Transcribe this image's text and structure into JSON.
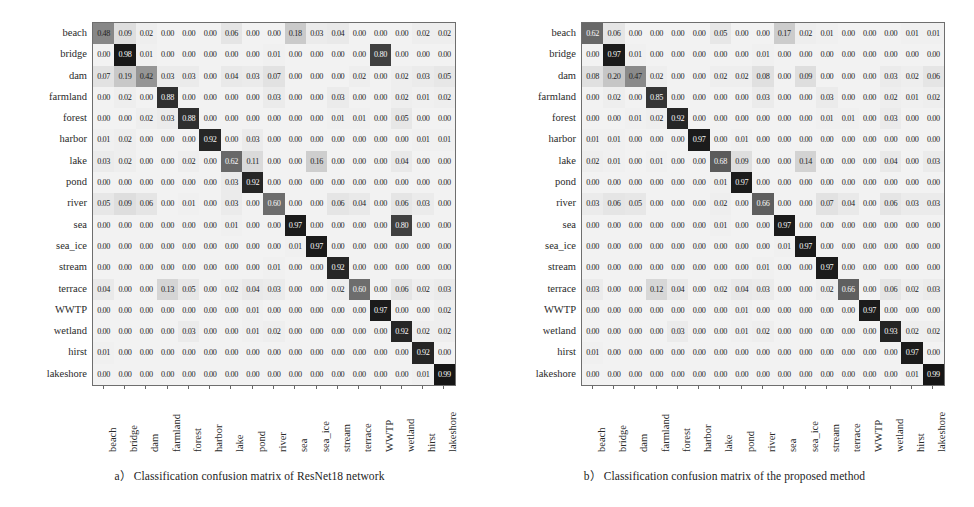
{
  "figure": {
    "type": "two-panel-confusion-matrix-figure",
    "background": "#ffffff"
  },
  "labels": [
    "beach",
    "bridge",
    "dam",
    "farmland",
    "forest",
    "harbor",
    "lake",
    "pond",
    "river",
    "sea",
    "sea_ice",
    "stream",
    "terrace",
    "WWTP",
    "wetland",
    "hirst",
    "lakeshore"
  ],
  "panels": [
    {
      "id": "a",
      "caption": "a） Classification confusion matrix of ResNet18 network"
    },
    {
      "id": "b",
      "caption": "b） Classification confusion matrix of the proposed method"
    }
  ],
  "chart_data": [
    {
      "type": "heatmap",
      "title": "a） Classification confusion matrix of ResNet18 network",
      "xlabel": "",
      "ylabel": "",
      "grid": true,
      "legend": "none",
      "colormap": "greys",
      "vmin": 0.0,
      "vmax": 1.0,
      "categories": [
        "beach",
        "bridge",
        "dam",
        "farmland",
        "forest",
        "harbor",
        "lake",
        "pond",
        "river",
        "sea",
        "sea_ice",
        "stream",
        "terrace",
        "WWTP",
        "wetland",
        "hirst",
        "lakeshore"
      ],
      "x": [
        "beach",
        "bridge",
        "dam",
        "farmland",
        "forest",
        "harbor",
        "lake",
        "pond",
        "river",
        "sea",
        "sea_ice",
        "stream",
        "terrace",
        "WWTP",
        "wetland",
        "hirst",
        "lakeshore"
      ],
      "y": [
        "beach",
        "bridge",
        "dam",
        "farmland",
        "forest",
        "harbor",
        "lake",
        "pond",
        "river",
        "sea",
        "sea_ice",
        "stream",
        "terrace",
        "WWTP",
        "wetland",
        "hirst",
        "lakeshore"
      ],
      "values": [
        [
          0.48,
          0.09,
          0.02,
          0.0,
          0.0,
          0.0,
          0.06,
          0.0,
          0.0,
          0.18,
          0.03,
          0.04,
          0.0,
          0.0,
          0.0,
          0.02,
          0.02
        ],
        [
          0.0,
          0.98,
          0.01,
          0.0,
          0.0,
          0.0,
          0.0,
          0.0,
          0.01,
          0.0,
          0.0,
          0.0,
          0.0,
          0.8,
          0.0,
          0.0,
          0.0
        ],
        [
          0.07,
          0.19,
          0.42,
          0.03,
          0.03,
          0.0,
          0.04,
          0.03,
          0.07,
          0.0,
          0.0,
          0.0,
          0.02,
          0.0,
          0.02,
          0.03,
          0.05
        ],
        [
          0.0,
          0.02,
          0.0,
          0.88,
          0.0,
          0.0,
          0.0,
          0.0,
          0.03,
          0.0,
          0.0,
          0.03,
          0.0,
          0.0,
          0.02,
          0.01,
          0.02
        ],
        [
          0.0,
          0.0,
          0.02,
          0.03,
          0.88,
          0.0,
          0.0,
          0.0,
          0.0,
          0.0,
          0.0,
          0.01,
          0.01,
          0.0,
          0.05,
          0.0,
          0.0
        ],
        [
          0.01,
          0.02,
          0.0,
          0.0,
          0.0,
          0.92,
          0.0,
          0.03,
          0.0,
          0.0,
          0.0,
          0.0,
          0.0,
          0.0,
          0.0,
          0.01,
          0.01
        ],
        [
          0.03,
          0.02,
          0.0,
          0.0,
          0.02,
          0.0,
          0.62,
          0.11,
          0.0,
          0.0,
          0.16,
          0.0,
          0.0,
          0.0,
          0.04,
          0.0,
          0.0
        ],
        [
          0.0,
          0.0,
          0.0,
          0.0,
          0.0,
          0.0,
          0.03,
          0.92,
          0.0,
          0.0,
          0.0,
          0.0,
          0.0,
          0.0,
          0.0,
          0.0,
          0.0
        ],
        [
          0.05,
          0.09,
          0.06,
          0.0,
          0.01,
          0.0,
          0.03,
          0.0,
          0.6,
          0.0,
          0.0,
          0.06,
          0.04,
          0.0,
          0.06,
          0.03,
          0.0
        ],
        [
          0.0,
          0.0,
          0.0,
          0.0,
          0.0,
          0.0,
          0.01,
          0.0,
          0.0,
          0.97,
          0.0,
          0.0,
          0.0,
          0.0,
          0.8,
          0.0,
          0.0
        ],
        [
          0.0,
          0.0,
          0.0,
          0.0,
          0.0,
          0.0,
          0.0,
          0.0,
          0.0,
          0.01,
          0.97,
          0.0,
          0.0,
          0.0,
          0.0,
          0.0,
          0.0
        ],
        [
          0.0,
          0.0,
          0.0,
          0.0,
          0.0,
          0.0,
          0.0,
          0.0,
          0.01,
          0.0,
          0.0,
          0.92,
          0.0,
          0.0,
          0.0,
          0.0,
          0.0
        ],
        [
          0.04,
          0.0,
          0.0,
          0.13,
          0.05,
          0.0,
          0.02,
          0.04,
          0.03,
          0.0,
          0.0,
          0.02,
          0.6,
          0.0,
          0.06,
          0.02,
          0.03
        ],
        [
          0.0,
          0.0,
          0.0,
          0.0,
          0.0,
          0.0,
          0.0,
          0.01,
          0.0,
          0.0,
          0.0,
          0.0,
          0.0,
          0.97,
          0.0,
          0.0,
          0.02
        ],
        [
          0.0,
          0.0,
          0.0,
          0.0,
          0.03,
          0.0,
          0.0,
          0.01,
          0.02,
          0.0,
          0.0,
          0.0,
          0.0,
          0.0,
          0.92,
          0.02,
          0.02
        ],
        [
          0.01,
          0.0,
          0.0,
          0.0,
          0.0,
          0.0,
          0.0,
          0.0,
          0.0,
          0.0,
          0.0,
          0.0,
          0.0,
          0.0,
          0.0,
          0.92,
          0.0
        ],
        [
          0.0,
          0.0,
          0.0,
          0.0,
          0.0,
          0.0,
          0.0,
          0.0,
          0.0,
          0.0,
          0.0,
          0.0,
          0.0,
          0.0,
          0.0,
          0.01,
          0.99
        ]
      ]
    },
    {
      "type": "heatmap",
      "title": "b） Classification confusion matrix of the proposed method",
      "xlabel": "",
      "ylabel": "",
      "grid": true,
      "legend": "none",
      "colormap": "greys",
      "vmin": 0.0,
      "vmax": 1.0,
      "categories": [
        "beach",
        "bridge",
        "dam",
        "farmland",
        "forest",
        "harbor",
        "lake",
        "pond",
        "river",
        "sea",
        "sea_ice",
        "stream",
        "terrace",
        "WWTP",
        "wetland",
        "hirst",
        "lakeshore"
      ],
      "x": [
        "beach",
        "bridge",
        "dam",
        "farmland",
        "forest",
        "harbor",
        "lake",
        "pond",
        "river",
        "sea",
        "sea_ice",
        "stream",
        "terrace",
        "WWTP",
        "wetland",
        "hirst",
        "lakeshore"
      ],
      "y": [
        "beach",
        "bridge",
        "dam",
        "farmland",
        "forest",
        "harbor",
        "lake",
        "pond",
        "river",
        "sea",
        "sea_ice",
        "stream",
        "terrace",
        "WWTP",
        "wetland",
        "hirst",
        "lakeshore"
      ],
      "values": [
        [
          0.62,
          0.06,
          0.0,
          0.0,
          0.0,
          0.0,
          0.05,
          0.0,
          0.0,
          0.17,
          0.02,
          0.01,
          0.0,
          0.0,
          0.0,
          0.01,
          0.01
        ],
        [
          0.0,
          0.97,
          0.01,
          0.0,
          0.0,
          0.0,
          0.0,
          0.0,
          0.01,
          0.0,
          0.0,
          0.0,
          0.0,
          0.0,
          0.0,
          0.0,
          0.0
        ],
        [
          0.08,
          0.2,
          0.47,
          0.02,
          0.0,
          0.0,
          0.02,
          0.02,
          0.08,
          0.0,
          0.09,
          0.0,
          0.0,
          0.0,
          0.03,
          0.02,
          0.06
        ],
        [
          0.0,
          0.02,
          0.0,
          0.85,
          0.0,
          0.0,
          0.0,
          0.0,
          0.03,
          0.0,
          0.0,
          0.03,
          0.0,
          0.0,
          0.02,
          0.01,
          0.02
        ],
        [
          0.0,
          0.0,
          0.01,
          0.02,
          0.92,
          0.0,
          0.0,
          0.0,
          0.0,
          0.0,
          0.0,
          0.01,
          0.01,
          0.0,
          0.03,
          0.0,
          0.0
        ],
        [
          0.01,
          0.01,
          0.0,
          0.0,
          0.0,
          0.97,
          0.0,
          0.01,
          0.0,
          0.0,
          0.0,
          0.0,
          0.0,
          0.0,
          0.0,
          0.0,
          0.0
        ],
        [
          0.02,
          0.01,
          0.0,
          0.01,
          0.0,
          0.0,
          0.68,
          0.09,
          0.0,
          0.0,
          0.14,
          0.0,
          0.0,
          0.0,
          0.04,
          0.0,
          0.03
        ],
        [
          0.0,
          0.0,
          0.0,
          0.0,
          0.0,
          0.0,
          0.01,
          0.97,
          0.0,
          0.0,
          0.0,
          0.0,
          0.0,
          0.0,
          0.0,
          0.0,
          0.0
        ],
        [
          0.03,
          0.06,
          0.05,
          0.0,
          0.0,
          0.0,
          0.02,
          0.0,
          0.66,
          0.0,
          0.0,
          0.07,
          0.04,
          0.0,
          0.06,
          0.03,
          0.03
        ],
        [
          0.0,
          0.0,
          0.0,
          0.0,
          0.0,
          0.0,
          0.01,
          0.0,
          0.0,
          0.97,
          0.0,
          0.0,
          0.0,
          0.0,
          0.0,
          0.0,
          0.0
        ],
        [
          0.0,
          0.0,
          0.0,
          0.0,
          0.0,
          0.0,
          0.0,
          0.0,
          0.0,
          0.01,
          0.97,
          0.0,
          0.0,
          0.0,
          0.0,
          0.0,
          0.0
        ],
        [
          0.0,
          0.0,
          0.0,
          0.0,
          0.0,
          0.0,
          0.0,
          0.0,
          0.01,
          0.0,
          0.0,
          0.97,
          0.0,
          0.0,
          0.0,
          0.0,
          0.0
        ],
        [
          0.03,
          0.0,
          0.0,
          0.12,
          0.04,
          0.0,
          0.02,
          0.04,
          0.03,
          0.0,
          0.0,
          0.02,
          0.66,
          0.0,
          0.06,
          0.02,
          0.03
        ],
        [
          0.0,
          0.0,
          0.0,
          0.0,
          0.0,
          0.0,
          0.0,
          0.01,
          0.0,
          0.0,
          0.0,
          0.0,
          0.0,
          0.97,
          0.0,
          0.0,
          0.0
        ],
        [
          0.0,
          0.0,
          0.0,
          0.0,
          0.03,
          0.0,
          0.0,
          0.01,
          0.02,
          0.0,
          0.0,
          0.0,
          0.0,
          0.0,
          0.93,
          0.02,
          0.02
        ],
        [
          0.01,
          0.0,
          0.0,
          0.0,
          0.0,
          0.0,
          0.0,
          0.0,
          0.0,
          0.0,
          0.0,
          0.0,
          0.0,
          0.0,
          0.0,
          0.97,
          0.0
        ],
        [
          0.0,
          0.0,
          0.0,
          0.0,
          0.0,
          0.0,
          0.0,
          0.0,
          0.0,
          0.0,
          0.0,
          0.0,
          0.0,
          0.0,
          0.0,
          0.01,
          0.99
        ]
      ]
    }
  ]
}
